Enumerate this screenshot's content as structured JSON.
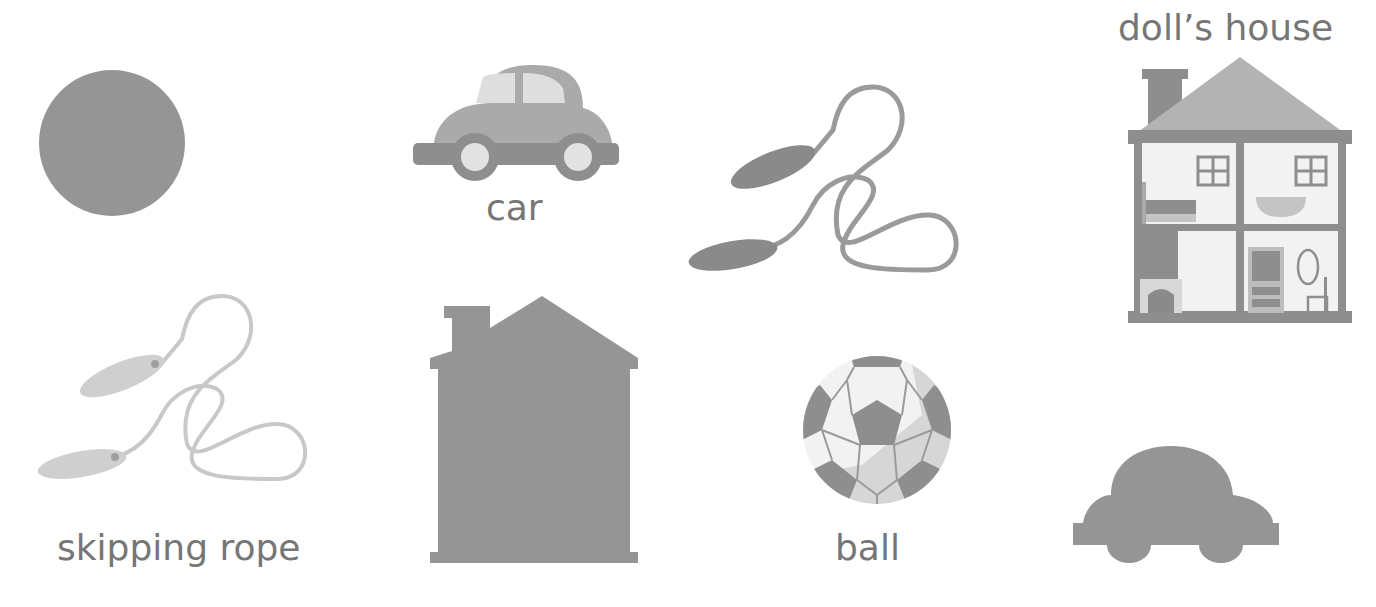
{
  "worksheet": {
    "items": [
      {
        "id": "ball-silhouette",
        "label": ""
      },
      {
        "id": "car-picture",
        "label": "car"
      },
      {
        "id": "rope-dark",
        "label": ""
      },
      {
        "id": "dolls-house-picture",
        "label": "doll’s house"
      },
      {
        "id": "skipping-rope-picture",
        "label": "skipping rope"
      },
      {
        "id": "house-silhouette",
        "label": ""
      },
      {
        "id": "ball-picture",
        "label": "ball"
      },
      {
        "id": "car-silhouette",
        "label": ""
      }
    ]
  },
  "colors": {
    "dark": "#8c8c8c",
    "mid": "#a8a8a8",
    "light": "#d2d2d2",
    "lighter": "#e6e6e6",
    "text": "#767676"
  }
}
